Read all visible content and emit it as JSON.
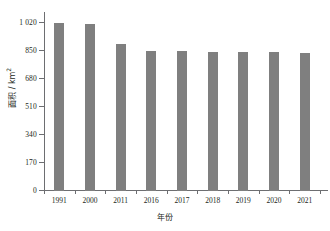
{
  "chart_data": {
    "type": "bar",
    "title": "",
    "subtitle": "",
    "xlabel": "年份",
    "ylabel": "面积 / km²",
    "ylabel_main": "面积 / km",
    "ylabel_exponent": "2",
    "categories": [
      "1991",
      "2000",
      "2011",
      "2016",
      "2017",
      "2018",
      "2019",
      "2020",
      "2021"
    ],
    "values": [
      1020,
      1018,
      892,
      850,
      850,
      845,
      844,
      843,
      842
    ],
    "ylim": [
      0,
      1071
    ],
    "yticks": [
      0,
      170,
      340,
      510,
      680,
      850,
      1020
    ],
    "ytick_labels": [
      "0",
      "170",
      "340",
      "510",
      "680",
      "850",
      "1 020"
    ],
    "grid": false,
    "legend": null,
    "bar_color": "#7f7f7f",
    "axis_color": "#6d6e71",
    "background": "#ffffff",
    "series": [
      {
        "name": "面积",
        "values": [
          1020,
          1018,
          892,
          850,
          850,
          845,
          844,
          843,
          842
        ]
      }
    ]
  }
}
